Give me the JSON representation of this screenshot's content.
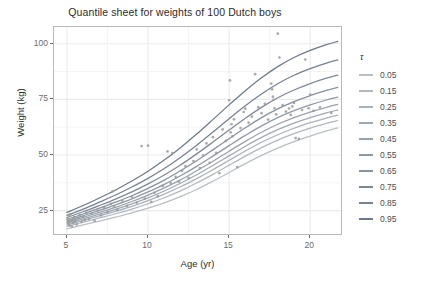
{
  "chart": {
    "title": "Quantile sheet for weights of 100 Dutch boys",
    "xlabel": "Age (yr)",
    "ylabel": "Weight (kg)"
  },
  "legend": {
    "title": "τ"
  },
  "chart_data": {
    "type": "line",
    "title": "Quantile sheet for weights of 100 Dutch boys",
    "xlabel": "Age (yr)",
    "ylabel": "Weight (kg)",
    "xlim": [
      4.2,
      21.9
    ],
    "ylim": [
      14.5,
      107.5
    ],
    "xticks": [
      5,
      10,
      15,
      20
    ],
    "yticks": [
      25,
      50,
      75,
      100
    ],
    "grid": true,
    "legend_position": "right",
    "legend_title": "τ",
    "line_color_range": [
      "#b0b7c0",
      "#6f7a88"
    ],
    "point_color": "#9a9a9a",
    "panel_background": "#ffffff",
    "grid_color": "#ebebeb",
    "x": [
      5.0,
      6.0,
      7.0,
      8.0,
      9.0,
      10.0,
      11.0,
      12.0,
      13.0,
      14.0,
      15.0,
      16.0,
      17.0,
      18.0,
      19.0,
      20.0,
      21.0,
      21.7
    ],
    "series": [
      {
        "name": "0.05",
        "color": "#b9bfc7",
        "values": [
          16.8,
          18.6,
          20.3,
          22.1,
          24.0,
          26.1,
          28.5,
          31.3,
          34.5,
          38.2,
          42.1,
          46.1,
          49.8,
          53.1,
          56.0,
          58.5,
          60.8,
          62.2
        ]
      },
      {
        "name": "0.15",
        "color": "#b1b8c1",
        "values": [
          17.9,
          19.8,
          21.7,
          23.6,
          25.7,
          28.1,
          30.8,
          33.9,
          37.4,
          41.3,
          45.4,
          49.5,
          53.3,
          56.7,
          59.6,
          62.1,
          64.2,
          65.5
        ]
      },
      {
        "name": "0.25",
        "color": "#a9b1bb",
        "values": [
          18.6,
          20.6,
          22.6,
          24.7,
          26.9,
          29.5,
          32.4,
          35.7,
          39.4,
          43.4,
          47.6,
          51.8,
          55.7,
          59.1,
          62.0,
          64.5,
          66.6,
          67.9
        ]
      },
      {
        "name": "0.35",
        "color": "#a0a9b4",
        "values": [
          19.2,
          21.3,
          23.4,
          25.6,
          28.0,
          30.7,
          33.8,
          37.3,
          41.1,
          45.3,
          49.6,
          53.9,
          57.9,
          61.4,
          64.3,
          66.8,
          68.9,
          70.2
        ]
      },
      {
        "name": "0.45",
        "color": "#98a1ad",
        "values": [
          19.8,
          22.0,
          24.2,
          26.5,
          29.1,
          32.0,
          35.2,
          38.8,
          42.9,
          47.2,
          51.7,
          56.1,
          60.2,
          63.8,
          66.8,
          69.3,
          71.4,
          72.7
        ]
      },
      {
        "name": "0.55",
        "color": "#8f99a6",
        "values": [
          20.4,
          22.7,
          25.1,
          27.6,
          30.3,
          33.4,
          36.8,
          40.7,
          44.9,
          49.5,
          54.2,
          58.8,
          63.1,
          66.8,
          69.9,
          72.5,
          74.7,
          76.0
        ]
      },
      {
        "name": "0.65",
        "color": "#87919f",
        "values": [
          21.1,
          23.5,
          26.1,
          28.8,
          31.7,
          35.0,
          38.7,
          42.9,
          47.4,
          52.3,
          57.3,
          62.2,
          66.8,
          70.7,
          74.0,
          76.7,
          79.0,
          80.4
        ]
      },
      {
        "name": "0.75",
        "color": "#7e8998",
        "values": [
          21.9,
          24.5,
          27.3,
          30.2,
          33.4,
          37.0,
          41.0,
          45.5,
          50.5,
          55.8,
          61.2,
          66.5,
          71.4,
          75.7,
          79.2,
          82.1,
          84.5,
          85.9
        ]
      },
      {
        "name": "0.85",
        "color": "#768191",
        "values": [
          22.9,
          25.7,
          28.8,
          32.0,
          35.6,
          39.5,
          43.9,
          48.9,
          54.4,
          60.3,
          66.3,
          72.1,
          77.4,
          82.0,
          85.8,
          88.8,
          91.3,
          92.7
        ]
      },
      {
        "name": "0.95",
        "color": "#6d798a",
        "values": [
          24.2,
          27.3,
          30.7,
          34.3,
          38.3,
          42.7,
          47.7,
          53.3,
          59.4,
          65.9,
          72.5,
          78.9,
          84.7,
          89.7,
          93.8,
          97.0,
          99.6,
          101.0
        ]
      }
    ],
    "points": [
      [
        5.05,
        21.5
      ],
      [
        5.08,
        20.0
      ],
      [
        5.1,
        19.2
      ],
      [
        5.12,
        22.8
      ],
      [
        5.15,
        18.4
      ],
      [
        5.2,
        23.4
      ],
      [
        5.25,
        20.6
      ],
      [
        5.3,
        17.9
      ],
      [
        5.35,
        21.0
      ],
      [
        5.4,
        19.6
      ],
      [
        5.45,
        22.1
      ],
      [
        5.5,
        20.2
      ],
      [
        5.6,
        18.8
      ],
      [
        5.7,
        21.7
      ],
      [
        5.8,
        23.0
      ],
      [
        5.9,
        19.9
      ],
      [
        6.0,
        22.4
      ],
      [
        6.1,
        20.8
      ],
      [
        6.2,
        24.1
      ],
      [
        6.35,
        21.3
      ],
      [
        6.5,
        23.7
      ],
      [
        6.7,
        20.5
      ],
      [
        6.9,
        25.0
      ],
      [
        7.1,
        22.9
      ],
      [
        7.3,
        26.2
      ],
      [
        7.5,
        24.4
      ],
      [
        7.7,
        28.0
      ],
      [
        7.8,
        33.6
      ],
      [
        7.9,
        26.8
      ],
      [
        8.1,
        25.3
      ],
      [
        8.4,
        29.5
      ],
      [
        8.7,
        27.1
      ],
      [
        9.0,
        31.2
      ],
      [
        9.3,
        28.6
      ],
      [
        9.6,
        54.0
      ],
      [
        9.8,
        30.4
      ],
      [
        10.0,
        54.2
      ],
      [
        10.2,
        28.9
      ],
      [
        10.4,
        33.0
      ],
      [
        10.6,
        31.5
      ],
      [
        10.9,
        36.1
      ],
      [
        11.2,
        51.6
      ],
      [
        11.4,
        37.4
      ],
      [
        11.5,
        50.9
      ],
      [
        11.7,
        40.2
      ],
      [
        11.9,
        38.0
      ],
      [
        12.1,
        42.8
      ],
      [
        12.3,
        45.0
      ],
      [
        12.5,
        39.7
      ],
      [
        12.8,
        47.3
      ],
      [
        13.0,
        52.5
      ],
      [
        13.2,
        44.1
      ],
      [
        13.4,
        49.8
      ],
      [
        13.6,
        55.2
      ],
      [
        13.8,
        46.5
      ],
      [
        14.0,
        58.0
      ],
      [
        14.2,
        51.0
      ],
      [
        14.4,
        41.8
      ],
      [
        14.6,
        61.5
      ],
      [
        14.8,
        56.3
      ],
      [
        15.0,
        74.6
      ],
      [
        15.05,
        83.5
      ],
      [
        15.1,
        60.2
      ],
      [
        15.15,
        63.8
      ],
      [
        15.2,
        58.4
      ],
      [
        15.3,
        66.0
      ],
      [
        15.5,
        44.6
      ],
      [
        15.7,
        62.1
      ],
      [
        15.9,
        69.3
      ],
      [
        16.0,
        70.8
      ],
      [
        16.2,
        64.5
      ],
      [
        16.4,
        67.2
      ],
      [
        16.6,
        86.3
      ],
      [
        16.8,
        71.5
      ],
      [
        17.0,
        68.8
      ],
      [
        17.2,
        73.0
      ],
      [
        17.4,
        65.9
      ],
      [
        17.6,
        82.1
      ],
      [
        17.65,
        79.5
      ],
      [
        17.7,
        76.2
      ],
      [
        17.75,
        74.8
      ],
      [
        17.8,
        71.0
      ],
      [
        17.9,
        68.2
      ],
      [
        18.0,
        104.5
      ],
      [
        18.1,
        93.8
      ],
      [
        18.3,
        72.4
      ],
      [
        18.5,
        69.5
      ],
      [
        18.7,
        70.9
      ],
      [
        18.8,
        68.0
      ],
      [
        18.9,
        71.8
      ],
      [
        19.0,
        73.4
      ],
      [
        19.1,
        57.6
      ],
      [
        19.3,
        57.2
      ],
      [
        19.5,
        70.2
      ],
      [
        19.7,
        92.9
      ],
      [
        19.9,
        71.0
      ],
      [
        20.0,
        77.1
      ],
      [
        20.2,
        69.8
      ],
      [
        20.6,
        71.4
      ],
      [
        21.3,
        68.9
      ]
    ]
  },
  "y_ticks": [
    {
      "label": "100",
      "value": 100
    },
    {
      "label": "75",
      "value": 75
    },
    {
      "label": "50",
      "value": 50
    },
    {
      "label": "25",
      "value": 25
    }
  ],
  "x_ticks": [
    {
      "label": "5",
      "value": 5
    },
    {
      "label": "10",
      "value": 10
    },
    {
      "label": "15",
      "value": 15
    },
    {
      "label": "20",
      "value": 20
    }
  ]
}
